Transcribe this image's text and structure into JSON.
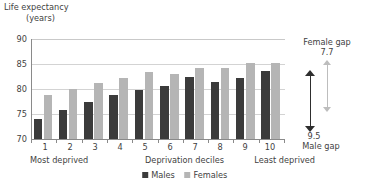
{
  "chart_data": {
    "type": "bar",
    "title": "Life expectancy (years)",
    "title_line1": "Life expectancy",
    "title_line2": "(years)",
    "xlabel": "Deprivation deciles",
    "ylabel": "Life expectancy (years)",
    "ylim": [
      70,
      90
    ],
    "yticks": [
      70,
      75,
      80,
      85,
      90
    ],
    "grid": true,
    "legend_position": "bottom",
    "categories": [
      "1",
      "2",
      "3",
      "4",
      "5",
      "6",
      "7",
      "8",
      "9",
      "10"
    ],
    "series": [
      {
        "name": "Males",
        "color": "#3b3b3b",
        "values": [
          74.1,
          75.8,
          77.4,
          78.8,
          79.8,
          80.6,
          82.5,
          81.4,
          82.3,
          83.6
        ]
      },
      {
        "name": "Females",
        "color": "#b5b5b5",
        "values": [
          78.8,
          80.0,
          81.3,
          82.2,
          83.4,
          83.0,
          84.2,
          84.2,
          85.2,
          85.3
        ]
      }
    ],
    "axis_captions": {
      "left": "Most deprived",
      "middle": "Deprivation deciles",
      "right": "Least deprived"
    },
    "annotations": [
      {
        "name": "female-gap",
        "label": "Female gap",
        "value": "7.7",
        "color": "#bdbdbd",
        "from": 85.3,
        "to": 77.6
      },
      {
        "name": "male-gap",
        "label": "Male gap",
        "value": "9.5",
        "color": "#2e2e2e",
        "from": 83.6,
        "to": 74.1
      }
    ]
  },
  "legend": {
    "males": "Males",
    "females": "Females"
  },
  "yticks": {
    "t0": "90",
    "t1": "85",
    "t2": "80",
    "t3": "75",
    "t4": "70"
  },
  "xnums": {
    "n0": "1",
    "n1": "2",
    "n2": "3",
    "n3": "4",
    "n4": "5",
    "n5": "6",
    "n6": "7",
    "n7": "8",
    "n8": "9",
    "n9": "10"
  },
  "captions": {
    "most": "Most deprived",
    "mid": "Deprivation deciles",
    "least": "Least deprived"
  },
  "annotations": {
    "female_label": "Female gap",
    "female_value": "7.7",
    "male_label": "Male gap",
    "male_value": "9.5"
  }
}
